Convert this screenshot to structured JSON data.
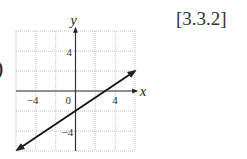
{
  "label_paren": ")",
  "reference": "[3.3.2]",
  "chart_data": {
    "type": "line",
    "title": "",
    "xlabel": "x",
    "ylabel": "y",
    "xlim": [
      -6,
      6
    ],
    "ylim": [
      -6,
      6
    ],
    "grid": true,
    "grid_step": 2,
    "x_tick_labels": [
      "-4",
      "0",
      "4"
    ],
    "y_tick_labels": [
      "4",
      "-4"
    ],
    "series": [
      {
        "name": "y = (2/3)x - 2",
        "x": [
          -6,
          6
        ],
        "y": [
          -6,
          2
        ],
        "arrows": "both"
      }
    ],
    "legend": null
  }
}
